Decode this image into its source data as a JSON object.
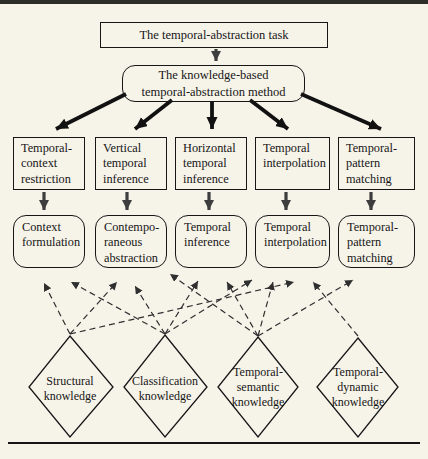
{
  "page": {
    "background": "#f6f3e9",
    "top_bar_color": "#2e2c26",
    "rule_color": "#141414",
    "ink_color": "#161616",
    "solid_arrow_color": "#111111",
    "minor_arrow_color": "#3d3d3d",
    "dashed_arrow_color": "#2f2f2f"
  },
  "task_box": {
    "label": "The temporal-abstraction task"
  },
  "method_box": {
    "lines": [
      "The knowledge-based",
      "temporal-abstraction method"
    ]
  },
  "subtasks": [
    {
      "lines": [
        "Temporal-",
        "context",
        "restriction"
      ]
    },
    {
      "lines": [
        "Vertical",
        "temporal",
        "inference"
      ]
    },
    {
      "lines": [
        "Horizontal",
        "temporal",
        "inference"
      ]
    },
    {
      "lines": [
        "Temporal",
        "interpolation"
      ]
    },
    {
      "lines": [
        "Temporal-",
        "pattern",
        "matching"
      ]
    }
  ],
  "mechanisms": [
    {
      "lines": [
        "Context",
        "formulation"
      ]
    },
    {
      "lines": [
        "Contempo-",
        "raneous",
        "abstraction"
      ]
    },
    {
      "lines": [
        "Temporal",
        "inference"
      ]
    },
    {
      "lines": [
        "Temporal",
        "interpolation"
      ]
    },
    {
      "lines": [
        "Temporal-",
        "pattern",
        "matching"
      ]
    }
  ],
  "knowledge_types": [
    {
      "lines": [
        "Structural",
        "knowledge"
      ]
    },
    {
      "lines": [
        "Classification",
        "knowledge"
      ]
    },
    {
      "lines": [
        "Temporal-",
        "semantic",
        "knowledge"
      ]
    },
    {
      "lines": [
        "Temporal-",
        "dynamic",
        "knowledge"
      ]
    }
  ],
  "dependencies": [
    {
      "from": "Structural knowledge",
      "to": "Context formulation"
    },
    {
      "from": "Structural knowledge",
      "to": "Contemporaneous abstraction"
    },
    {
      "from": "Structural knowledge",
      "to": "Temporal interpolation"
    },
    {
      "from": "Classification knowledge",
      "to": "Context formulation"
    },
    {
      "from": "Classification knowledge",
      "to": "Contemporaneous abstraction"
    },
    {
      "from": "Classification knowledge",
      "to": "Temporal inference"
    },
    {
      "from": "Classification knowledge",
      "to": "Temporal interpolation"
    },
    {
      "from": "Temporal-semantic knowledge",
      "to": "Contemporaneous abstraction"
    },
    {
      "from": "Temporal-semantic knowledge",
      "to": "Temporal inference"
    },
    {
      "from": "Temporal-semantic knowledge",
      "to": "Temporal interpolation"
    },
    {
      "from": "Temporal-semantic knowledge",
      "to": "Temporal-pattern matching"
    },
    {
      "from": "Temporal-dynamic knowledge",
      "to": "Temporal interpolation"
    }
  ]
}
